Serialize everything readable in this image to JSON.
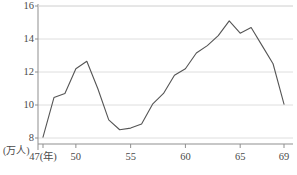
{
  "chart_data": {
    "type": "line",
    "title": "",
    "xlabel": "47(年)",
    "ylabel": "(万人)",
    "x_unit_label": "(年)",
    "y_unit_label": "(万人)",
    "xlim": [
      47,
      69
    ],
    "ylim": [
      7.3,
      16
    ],
    "grid": true,
    "grid_axis": "y",
    "legend": false,
    "x": [
      47,
      48,
      49,
      50,
      51,
      52,
      53,
      54,
      55,
      56,
      57,
      58,
      59,
      60,
      61,
      62,
      63,
      64,
      65,
      66,
      67,
      68,
      69
    ],
    "values": [
      8.05,
      10.45,
      10.7,
      12.2,
      12.65,
      11.0,
      9.1,
      8.5,
      8.6,
      8.85,
      10.05,
      10.7,
      11.8,
      12.2,
      13.15,
      13.6,
      14.2,
      15.1,
      14.35,
      14.7,
      13.6,
      12.5,
      10.05
    ],
    "series": [
      {
        "name": "",
        "color": "#555555",
        "values": [
          8.05,
          10.45,
          10.7,
          12.2,
          12.65,
          11.0,
          9.1,
          8.5,
          8.6,
          8.85,
          10.05,
          10.7,
          11.8,
          12.2,
          13.15,
          13.6,
          14.2,
          15.1,
          14.35,
          14.7,
          13.6,
          12.5,
          10.05
        ]
      }
    ],
    "y_ticks": [
      8,
      10,
      12,
      14,
      16
    ],
    "y_tick_labels": [
      "8",
      "10",
      "12",
      "14",
      "16"
    ],
    "x_ticks": [
      47,
      50,
      55,
      60,
      65,
      69
    ],
    "x_tick_labels": [
      "47(年)",
      "50",
      "55",
      "60",
      "65",
      "69"
    ],
    "colors": {
      "line": "#555555",
      "grid": "#dedede",
      "axis": "#8f8f8f",
      "text": "#4a4a4a",
      "background": "#ffffff"
    }
  }
}
